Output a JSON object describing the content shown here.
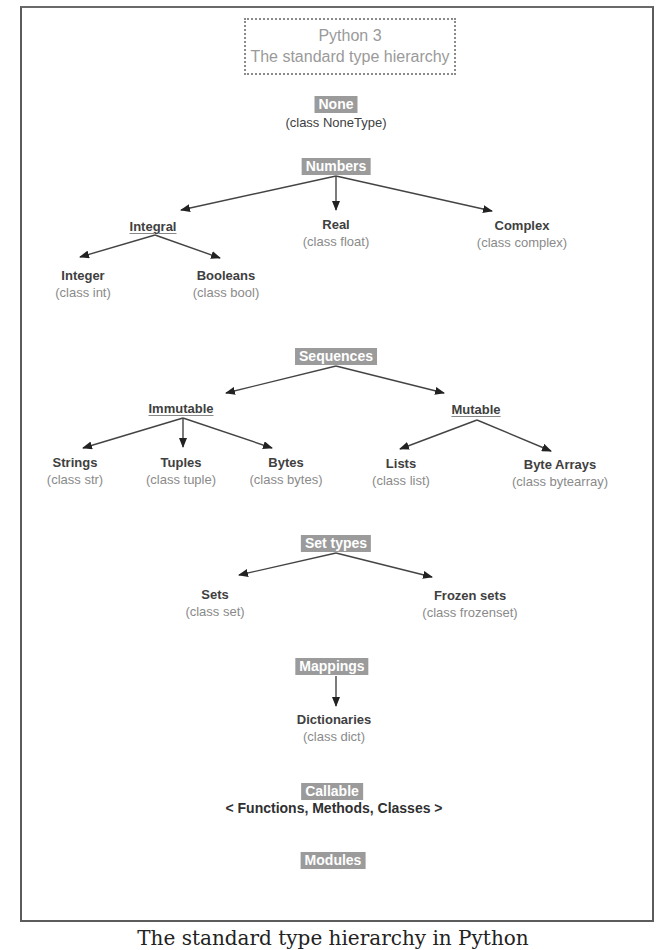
{
  "title": {
    "line1": "Python 3",
    "line2": "The standard type hierarchy"
  },
  "none": {
    "label": "None",
    "class": "(class NoneType)"
  },
  "numbers": {
    "label": "Numbers",
    "integral": {
      "label": "Integral",
      "integer": {
        "name": "Integer",
        "class": "(class int)"
      },
      "booleans": {
        "name": "Booleans",
        "class": "(class bool)"
      }
    },
    "real": {
      "name": "Real",
      "class": "(class float)"
    },
    "complex": {
      "name": "Complex",
      "class": "(class complex)"
    }
  },
  "sequences": {
    "label": "Sequences",
    "immutable": {
      "label": "Immutable",
      "strings": {
        "name": "Strings",
        "class": "(class str)"
      },
      "tuples": {
        "name": "Tuples",
        "class": "(class tuple)"
      },
      "bytes": {
        "name": "Bytes",
        "class": "(class bytes)"
      }
    },
    "mutable": {
      "label": "Mutable",
      "lists": {
        "name": "Lists",
        "class": "(class list)"
      },
      "bytearrays": {
        "name": "Byte Arrays",
        "class": "(class bytearray)"
      }
    }
  },
  "set_types": {
    "label": "Set types",
    "sets": {
      "name": "Sets",
      "class": "(class set)"
    },
    "frozensets": {
      "name": "Frozen sets",
      "class": "(class frozenset)"
    }
  },
  "mappings": {
    "label": "Mappings",
    "dictionaries": {
      "name": "Dictionaries",
      "class": "(class dict)"
    }
  },
  "callable": {
    "label": "Callable",
    "members": "< Functions, Methods, Classes >"
  },
  "modules": {
    "label": "Modules"
  },
  "caption": "The standard type hierarchy in Python",
  "colors": {
    "category_bg": "#9b9b9b",
    "category_text": "#ffffff",
    "node_text": "#404040",
    "class_text": "#8a8a8a",
    "title_text": "#9a9a9a",
    "frame": "#5c5c5c",
    "arrow": "#333333"
  }
}
